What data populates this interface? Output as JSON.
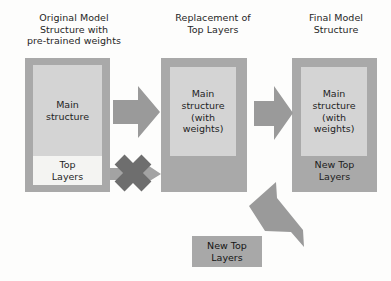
{
  "diagram": {
    "title_semantics": "transfer-learning-top-layer-replacement",
    "background_color": "#fdfdfc",
    "box_color": "#a9a9a9",
    "inner_box_color": "#d4d4d4",
    "top_layers_box_color": "#f4f4f2",
    "arrow_color": "#9d9d9d",
    "cross_color": "#6f6f6f"
  },
  "columns": [
    {
      "caption": "Original Model\nStructure with\npre-trained weights",
      "inner_label": "Main\nstructure",
      "bottom_label": "Top\nLayers"
    },
    {
      "caption": "Replacement of\nTop Layers",
      "inner_label": "Main\nstructure\n(with\nweights)",
      "bottom_label": ""
    },
    {
      "caption": "Final Model\nStructure",
      "inner_label": "Main\nstructure\n(with\nweights)",
      "bottom_label": "New Top\nLayers"
    }
  ],
  "standalone": {
    "new_top_layers_label": "New Top\nLayers"
  },
  "arrows": {
    "arrow1_name": "right-arrow-stage1-to-stage2",
    "arrow2_name": "right-arrow-stage2-to-stage3",
    "arrow3_name": "diagonal-arrow-new-top-layers-to-final",
    "removed_arrow_name": "removed-top-layers-arrow",
    "cross_name": "cross-mark-icon"
  }
}
